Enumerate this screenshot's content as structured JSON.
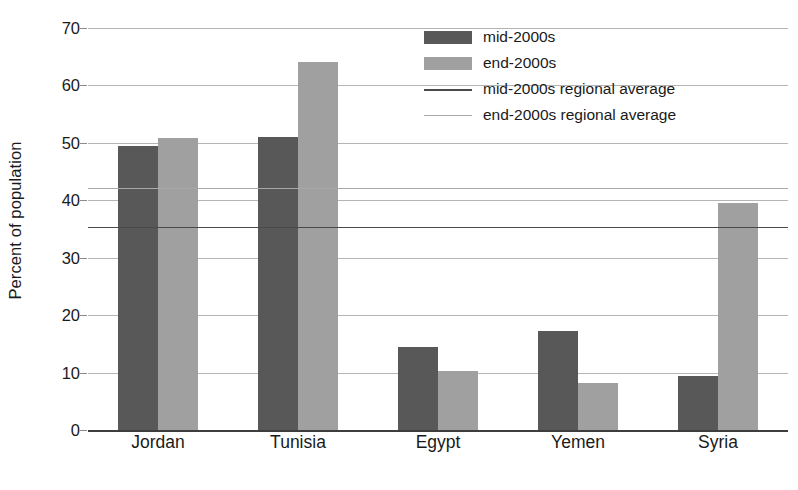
{
  "chart_data": {
    "type": "bar",
    "title": "",
    "xlabel": "",
    "ylabel": "Percent of population",
    "ylim": [
      0,
      70
    ],
    "yticks": [
      0,
      10,
      20,
      30,
      40,
      50,
      60,
      70
    ],
    "ytick_labels": [
      "0",
      "10",
      "20",
      "30",
      "40",
      "50",
      "60",
      "70"
    ],
    "grid": true,
    "legend_position": "top-right",
    "categories": [
      "Jordan",
      "Tunisia",
      "Egypt",
      "Yemen",
      "Syria"
    ],
    "series": [
      {
        "name": "mid-2000s",
        "color": "#585858",
        "values": [
          49.5,
          51.0,
          14.4,
          17.2,
          9.4
        ]
      },
      {
        "name": "end-2000s",
        "color": "#a0a0a0",
        "values": [
          50.8,
          64.0,
          10.2,
          8.1,
          39.5
        ]
      }
    ],
    "reference_lines": [
      {
        "name": "mid-2000s regional average",
        "value": 35.4,
        "color": "#4a4a4a"
      },
      {
        "name": "end-2000s regional average",
        "value": 42.2,
        "color": "#a8a8a8"
      }
    ]
  },
  "legend": {
    "items": [
      {
        "label": "mid-2000s",
        "kind": "swatch",
        "variant": "mid"
      },
      {
        "label": "end-2000s",
        "kind": "swatch",
        "variant": "end"
      },
      {
        "label": "mid-2000s regional average",
        "kind": "line",
        "variant": "line-mid"
      },
      {
        "label": "end-2000s regional average",
        "kind": "line",
        "variant": "line-end"
      }
    ]
  }
}
